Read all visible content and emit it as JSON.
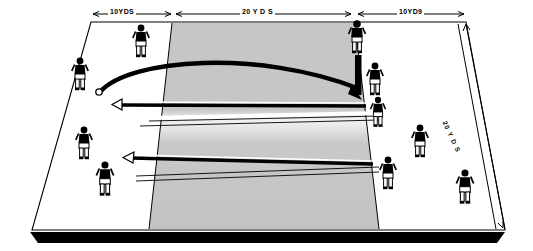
{
  "diagram": {
    "field": {
      "surface_color": "#ffffff",
      "zone_color": "#c6c6c6",
      "zone_band_color": "#efefef",
      "line_color": "#000000",
      "shadow_color": "#000000"
    },
    "dimensions": [
      {
        "name": "left-zone",
        "label": "10YDS",
        "value": 10,
        "unit": "YDS"
      },
      {
        "name": "center-zone",
        "label": "20 Y D S",
        "value": 20,
        "unit": "YDS"
      },
      {
        "name": "right-zone",
        "label": "10YD9",
        "value": 10,
        "unit": "YDS"
      },
      {
        "name": "depth",
        "label": "20 Y D S",
        "value": 20,
        "unit": "YDS"
      }
    ],
    "players": [
      {
        "id": "p1",
        "x": 141,
        "y": 28,
        "scale": 1.0,
        "facing": "front"
      },
      {
        "id": "p2",
        "x": 80,
        "y": 61,
        "scale": 1.0,
        "facing": "front"
      },
      {
        "id": "p3",
        "x": 84,
        "y": 130,
        "scale": 1.0,
        "facing": "front"
      },
      {
        "id": "p4",
        "x": 105,
        "y": 165,
        "scale": 1.05,
        "facing": "front"
      },
      {
        "id": "p5",
        "x": 357,
        "y": 24,
        "scale": 1.0,
        "facing": "front"
      },
      {
        "id": "p6",
        "x": 375,
        "y": 66,
        "scale": 1.0,
        "facing": "front"
      },
      {
        "id": "p7",
        "x": 378,
        "y": 100,
        "scale": 0.92,
        "facing": "front"
      },
      {
        "id": "p8",
        "x": 420,
        "y": 128,
        "scale": 1.0,
        "facing": "front"
      },
      {
        "id": "p9",
        "x": 388,
        "y": 160,
        "scale": 1.0,
        "facing": "front"
      },
      {
        "id": "p10",
        "x": 465,
        "y": 173,
        "scale": 1.05,
        "facing": "front"
      }
    ],
    "markers": [
      {
        "name": "goal-post-bar",
        "type": "vertical-bar",
        "x": 357,
        "y": 55,
        "w": 6,
        "h": 38
      },
      {
        "name": "ball",
        "type": "circle",
        "x": 99,
        "y": 92,
        "r": 3
      }
    ],
    "paths": [
      {
        "name": "pass-arc",
        "type": "arc",
        "from": [
          99,
          92
        ],
        "to": [
          360,
          90
        ],
        "style": "thick-curve"
      },
      {
        "name": "run-arrow-upper",
        "type": "arrow",
        "from": [
          366,
          105
        ],
        "to": [
          118,
          105
        ],
        "direction": "left"
      },
      {
        "name": "run-arrow-lower",
        "type": "arrow",
        "from": [
          372,
          163
        ],
        "to": [
          128,
          157
        ],
        "direction": "left"
      }
    ]
  }
}
